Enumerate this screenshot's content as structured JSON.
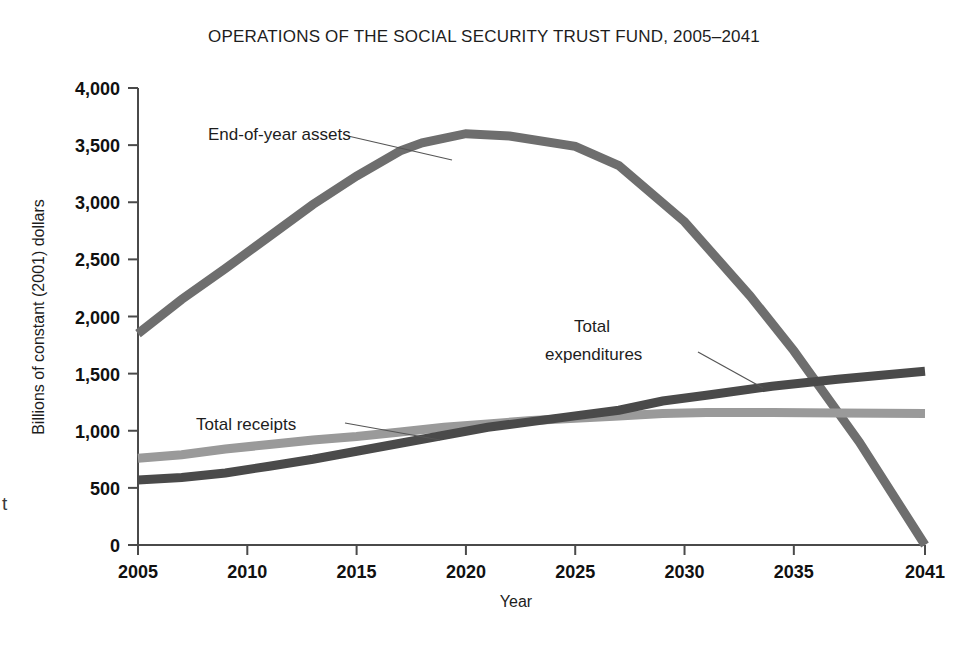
{
  "figure": {
    "title": "OPERATIONS OF THE SOCIAL SECURITY TRUST FUND, 2005–2041",
    "x_axis_title": "Year",
    "y_axis_title": "Billions of constant (2001) dollars",
    "edge_artifact": "t"
  },
  "chart_data": {
    "type": "line",
    "title": "OPERATIONS OF THE SOCIAL SECURITY TRUST FUND, 2005–2041",
    "xlabel": "Year",
    "ylabel": "Billions of constant (2001) dollars",
    "xlim": [
      2005,
      2041
    ],
    "ylim": [
      0,
      4000
    ],
    "grid": false,
    "legend_position": "inline-annotations",
    "x_ticks": [
      "2005",
      "2010",
      "2015",
      "2020",
      "2025",
      "2030",
      "2035",
      "2041"
    ],
    "x_tick_values": [
      2005,
      2010,
      2015,
      2020,
      2025,
      2030,
      2035,
      2041
    ],
    "y_ticks": [
      "0",
      "500",
      "1,000",
      "1,500",
      "2,000",
      "2,500",
      "3,000",
      "3,500",
      "4,000"
    ],
    "y_tick_values": [
      0,
      500,
      1000,
      1500,
      2000,
      2500,
      3000,
      3500,
      4000
    ],
    "series": [
      {
        "name": "End-of-year assets",
        "color": "#6e6e6e",
        "x": [
          2005,
          2007,
          2009,
          2011,
          2013,
          2015,
          2017,
          2018,
          2020,
          2022,
          2025,
          2027,
          2030,
          2033,
          2035,
          2038,
          2041
        ],
        "values": [
          1850,
          2150,
          2420,
          2700,
          2980,
          3230,
          3450,
          3520,
          3600,
          3580,
          3490,
          3320,
          2830,
          2180,
          1700,
          900,
          0
        ]
      },
      {
        "name": "Total receipts",
        "color": "#9a9a9a",
        "x": [
          2005,
          2007,
          2009,
          2011,
          2013,
          2015,
          2017,
          2019,
          2021,
          2023,
          2025,
          2027,
          2029,
          2031,
          2034,
          2037,
          2041
        ],
        "values": [
          760,
          790,
          840,
          880,
          920,
          950,
          990,
          1030,
          1060,
          1090,
          1110,
          1130,
          1150,
          1160,
          1160,
          1155,
          1150
        ]
      },
      {
        "name": "Total expenditures",
        "color": "#4a4a4a",
        "x": [
          2005,
          2007,
          2009,
          2011,
          2013,
          2015,
          2017,
          2019,
          2021,
          2023,
          2025,
          2027,
          2029,
          2031,
          2034,
          2037,
          2041
        ],
        "values": [
          570,
          590,
          630,
          690,
          750,
          820,
          890,
          960,
          1030,
          1080,
          1130,
          1180,
          1260,
          1310,
          1390,
          1450,
          1520
        ]
      }
    ],
    "annotations": [
      {
        "text": "End-of-year assets",
        "points_to_series": "End-of-year assets"
      },
      {
        "text_line1": "Total",
        "text_line2": "expenditures",
        "points_to_series": "Total expenditures"
      },
      {
        "text": "Total receipts",
        "points_to_series": "Total receipts"
      }
    ]
  }
}
